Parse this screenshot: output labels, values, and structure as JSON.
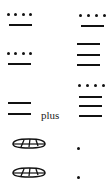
{
  "figure": {
    "left_column": [
      {
        "glyph": "four-dots-one-bar",
        "value": 9
      },
      {
        "glyph": "four-dots-one-bar",
        "value": 9
      },
      {
        "glyph": "two-bars",
        "value": 10
      },
      {
        "glyph": "shell",
        "value": 0
      },
      {
        "glyph": "shell",
        "value": 0
      }
    ],
    "operator": "plus",
    "right_column": [
      {
        "glyph": "four-dots-one-bar",
        "value": 9
      },
      {
        "glyph": "three-bars-four-dots",
        "value": 19
      },
      {
        "glyph": "three-bars",
        "value": 15
      },
      {
        "glyph": "one-dot",
        "value": 1
      },
      {
        "glyph": "one-dot",
        "value": 1
      }
    ],
    "colors": {
      "ink": "#111111",
      "background": "#ffffff"
    }
  }
}
